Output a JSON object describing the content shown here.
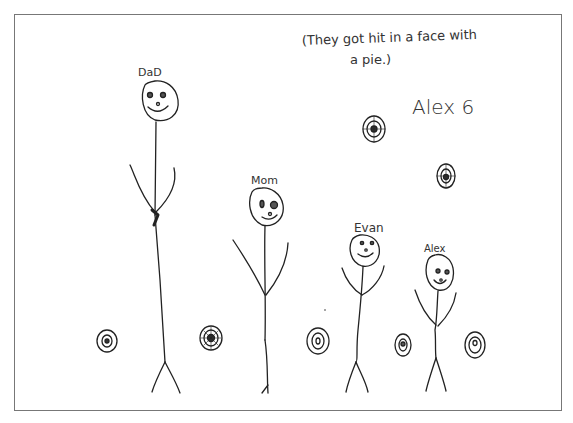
{
  "drawing": {
    "caption_line1": "(They got hit in a face with",
    "caption_line2": "a pie.)",
    "signature": "Alex 6",
    "figures": [
      {
        "label": "DaD"
      },
      {
        "label": "Mom"
      },
      {
        "label": "Evan"
      },
      {
        "label": "Alex"
      }
    ],
    "pie_count": 9,
    "ink_color": "#222222",
    "border_color": "#777777"
  }
}
